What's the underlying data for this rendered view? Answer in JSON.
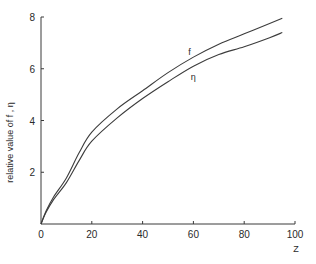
{
  "chart_data": {
    "type": "line",
    "title": "",
    "xlabel": "Z",
    "ylabel": "relative value of f , η",
    "xlim": [
      0,
      100
    ],
    "ylim": [
      0,
      8
    ],
    "x_ticks": [
      0,
      20,
      40,
      60,
      80,
      100
    ],
    "x_tick_labels": [
      "0",
      "20",
      "40",
      "60",
      "80",
      "100"
    ],
    "y_ticks": [
      2,
      4,
      6,
      8
    ],
    "y_tick_labels": [
      "2",
      "4",
      "6",
      "8"
    ],
    "grid": false,
    "legend": "none (curves labeled inline)",
    "series": [
      {
        "name": "f",
        "label": "f",
        "label_at": [
          58,
          6.55
        ],
        "x": [
          0,
          2,
          5,
          10,
          15,
          20,
          30,
          40,
          50,
          60,
          70,
          80,
          90,
          95
        ],
        "y": [
          0,
          0.5,
          1.05,
          1.78,
          2.75,
          3.55,
          4.45,
          5.15,
          5.85,
          6.45,
          6.95,
          7.35,
          7.75,
          7.95
        ]
      },
      {
        "name": "η",
        "label": "η",
        "label_at": [
          59,
          5.55
        ],
        "x": [
          0,
          2,
          5,
          10,
          15,
          20,
          30,
          40,
          50,
          60,
          70,
          80,
          90,
          95
        ],
        "y": [
          0,
          0.45,
          0.95,
          1.6,
          2.45,
          3.2,
          4.1,
          4.85,
          5.5,
          6.1,
          6.55,
          6.85,
          7.2,
          7.4
        ]
      }
    ]
  }
}
